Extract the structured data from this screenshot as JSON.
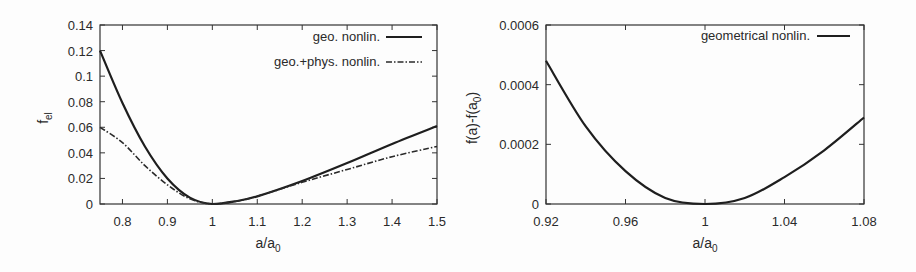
{
  "chart_data": [
    {
      "type": "line",
      "title": "",
      "xlabel": "a/a0",
      "ylabel": "f_el",
      "xlim": [
        0.75,
        1.5
      ],
      "ylim": [
        0,
        0.14
      ],
      "xticks": [
        "0.8",
        "0.9",
        "1",
        "1.1",
        "1.2",
        "1.3",
        "1.4",
        "1.5"
      ],
      "yticks": [
        "0",
        "0.02",
        "0.04",
        "0.06",
        "0.08",
        "0.1",
        "0.12",
        "0.14"
      ],
      "grid": false,
      "legend_position": "top-right",
      "series": [
        {
          "name": "geo. nonlin.",
          "style": "solid",
          "x": [
            0.75,
            0.8,
            0.85,
            0.9,
            0.95,
            1.0,
            1.05,
            1.1,
            1.2,
            1.3,
            1.4,
            1.5
          ],
          "y": [
            0.12,
            0.079,
            0.045,
            0.02,
            0.005,
            0.0,
            0.002,
            0.006,
            0.018,
            0.032,
            0.047,
            0.061
          ]
        },
        {
          "name": "geo.+phys. nonlin.",
          "style": "dash-dot",
          "x": [
            0.75,
            0.8,
            0.85,
            0.9,
            0.95,
            1.0,
            1.05,
            1.1,
            1.2,
            1.3,
            1.4,
            1.5
          ],
          "y": [
            0.06,
            0.048,
            0.03,
            0.015,
            0.004,
            0.0,
            0.002,
            0.006,
            0.017,
            0.027,
            0.037,
            0.045
          ]
        }
      ]
    },
    {
      "type": "line",
      "title": "",
      "xlabel": "a/a0",
      "ylabel": "f(a)-f(a0)",
      "xlim": [
        0.92,
        1.08
      ],
      "ylim": [
        0,
        0.0006
      ],
      "xticks": [
        "0.92",
        "0.96",
        "1",
        "1.04",
        "1.08"
      ],
      "yticks": [
        "0",
        "0.0002",
        "0.0004",
        "0.0006"
      ],
      "grid": false,
      "legend_position": "top-right",
      "series": [
        {
          "name": "geometrical nonlin.",
          "style": "solid",
          "x": [
            0.92,
            0.94,
            0.96,
            0.98,
            1.0,
            1.02,
            1.04,
            1.06,
            1.08
          ],
          "y": [
            0.00048,
            0.00026,
            0.00011,
            2e-05,
            0.0,
            2e-05,
            9e-05,
            0.00018,
            0.00029
          ]
        }
      ]
    }
  ]
}
